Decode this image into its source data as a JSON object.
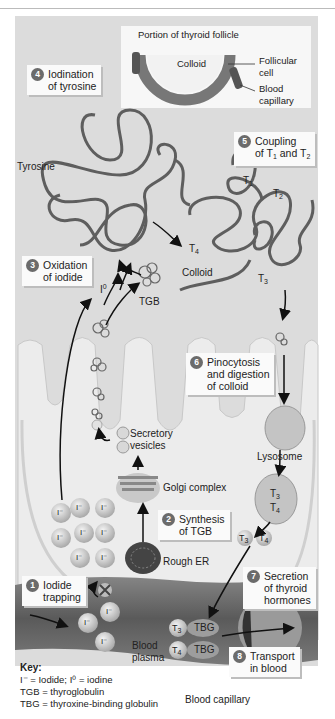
{
  "header": {
    "text": ""
  },
  "inset": {
    "title": "Portion of thyroid follicle",
    "colloid": "Colloid",
    "follicular_cell": [
      "Follicular",
      "cell"
    ],
    "blood_capillary": [
      "Blood",
      "capillary"
    ]
  },
  "steps": [
    {
      "num": "1",
      "lines": [
        "Iodide",
        "trapping"
      ]
    },
    {
      "num": "2",
      "lines": [
        "Synthesis",
        "of TGB"
      ]
    },
    {
      "num": "3",
      "lines": [
        "Oxidation",
        "of iodide"
      ]
    },
    {
      "num": "4",
      "lines": [
        "Iodination",
        "of tyrosine"
      ]
    },
    {
      "num": "5",
      "lines": [
        "Coupling",
        "of T1 and T2"
      ]
    },
    {
      "num": "6",
      "lines": [
        "Pinocytosis",
        "and digestion",
        "of colloid"
      ]
    },
    {
      "num": "7",
      "lines": [
        "Secretion",
        "of thyroid",
        "hormones"
      ]
    },
    {
      "num": "8",
      "lines": [
        "Transport",
        "in blood"
      ]
    }
  ],
  "labels": {
    "tyrosine": "Tyrosine",
    "colloid": "Colloid",
    "tgb": "TGB",
    "iodine": "I",
    "iodine_sup": "0",
    "t1": "T",
    "t1_sub": "1",
    "t2": "T",
    "t2_sub": "2",
    "t3": "T",
    "t3_sub": "3",
    "t4": "T",
    "t4_sub": "4",
    "secretory_vesicles": [
      "Secretory",
      "vesicles"
    ],
    "golgi": "Golgi complex",
    "rough_er": "Rough ER",
    "lysosome": "Lysosome",
    "blood_plasma": [
      "Blood",
      "plasma"
    ],
    "blood_capillary": "Blood capillary",
    "tbg": "TBG",
    "iodide_ion": "I⁻"
  },
  "key": {
    "title": "Key:",
    "lines": [
      "I⁻ = Iodide; I⁰ = iodine",
      "TGB = thyroglobulin",
      "TBG = thyroxine-binding globulin"
    ]
  },
  "colors": {
    "panel": "#dcdcdc",
    "cell": "#ececec",
    "capillary": "#6e6e6e",
    "box": "#fafafa",
    "badge": "#6b6b6b"
  }
}
